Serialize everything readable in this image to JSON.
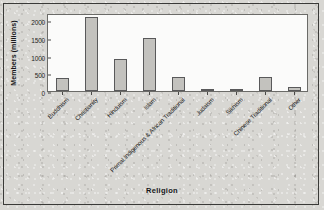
{
  "figure": {
    "y_axis_title": "Members (millions)",
    "x_axis_title": "Religion"
  },
  "chart_data": {
    "type": "bar",
    "title": "",
    "xlabel": "Religion",
    "ylabel": "Members (millions)",
    "ylim": [
      0,
      2200
    ],
    "yticks": [
      0,
      500,
      1000,
      1500,
      2000
    ],
    "ytick_labels": [
      "0",
      "500",
      "1000",
      "1500",
      "2000"
    ],
    "grid": false,
    "legend": "none",
    "bar_color": "#c3c2be",
    "bar_edge_color": "#59595a",
    "categories": [
      "Buddhism",
      "Christianity",
      "Hinduism",
      "Islam",
      "Primal Indigenous & African Traditional",
      "Judaism",
      "Sikhism",
      "Chinese Traditional",
      "Other"
    ],
    "values": [
      376,
      2100,
      900,
      1500,
      400,
      14,
      23,
      394,
      100
    ]
  }
}
